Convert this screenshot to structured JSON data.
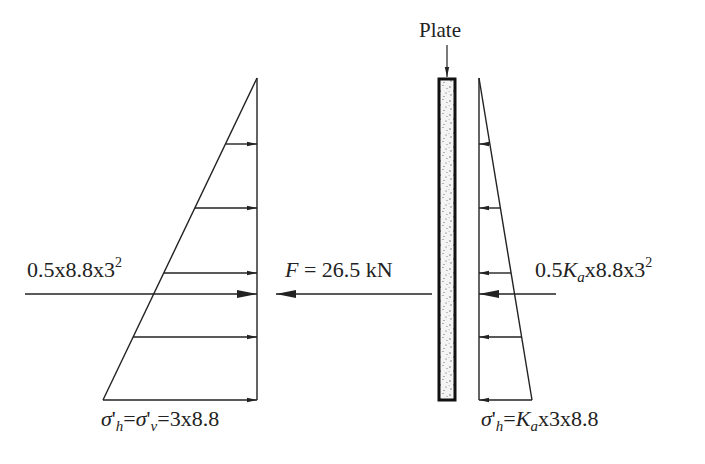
{
  "diagram": {
    "type": "earth-pressure-on-plate",
    "plate": {
      "label": "Plate"
    },
    "left_side": {
      "description": "Passive/at-rest side triangular stress distribution",
      "resultant_label": {
        "prefix": "0.5x8.8x3",
        "exponent": "2"
      },
      "base_stress_label": {
        "sigma": "σ",
        "prime_h": "'",
        "sub_h": "h",
        "eq": "=",
        "sigma2": "σ",
        "prime_v": "'",
        "sub_v": "v",
        "value": "=3x8.8"
      }
    },
    "middle": {
      "force_symbol": "F",
      "force_value": " = 26.5 kN"
    },
    "right_side": {
      "description": "Active side triangular stress distribution",
      "resultant_label": {
        "prefix": "0.5",
        "K": "K",
        "a": "a",
        "suffix": "x8.8x3",
        "exponent": "2"
      },
      "base_stress_label": {
        "sigma": "σ",
        "prime": "'",
        "sub_h": "h",
        "eq": "=",
        "K": "K",
        "a": "a",
        "value": "x3x8.8"
      }
    },
    "colors": {
      "line": "#222222",
      "plate_fill": "#f2f2f2",
      "plate_border": "#111111",
      "speckle": "#555555"
    }
  }
}
